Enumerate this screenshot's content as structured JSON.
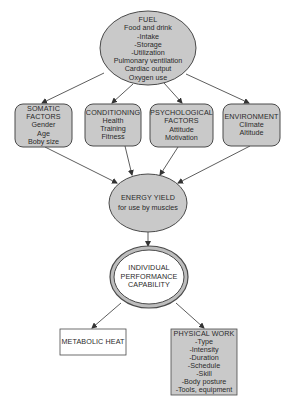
{
  "colors": {
    "fill": "#c9c9c9",
    "stroke": "#4a4a4a",
    "white_fill": "#ffffff"
  },
  "nodes": {
    "fuel": {
      "title": "FUEL",
      "lines": [
        "Food and drink",
        "-Intake",
        "-Storage",
        "-Utilization",
        "Pulmonary ventilation",
        "Cardiac output",
        "Oxygen use"
      ]
    },
    "somatic": {
      "title": "SOMATIC",
      "title2": "FACTORS",
      "lines": [
        "Gender",
        "Age",
        "Boby size"
      ]
    },
    "conditioning": {
      "title": "CONDITIONING",
      "lines": [
        "Health",
        "Training",
        "Fitness"
      ]
    },
    "psychological": {
      "title": "PSYCHOLOGICAL",
      "title2": "FACTORS",
      "lines": [
        "Attitude",
        "Motivation"
      ]
    },
    "environment": {
      "title": "ENVIRONMENT",
      "lines": [
        "Climate",
        "Altitude"
      ]
    },
    "energy": {
      "title": "ENERGY YIELD",
      "lines": [
        "for use by muscles"
      ]
    },
    "performance": {
      "lines": [
        "INDIVIDUAL",
        "PERFORMANCE",
        "CAPABILITY"
      ]
    },
    "metabolic": {
      "title": "METABOLIC HEAT"
    },
    "physical": {
      "title": "PHYSICAL WORK",
      "lines": [
        "-Type",
        "-Intensity",
        "-Duration",
        "-Schedule",
        "-Skill",
        "-Body posture",
        "-Tools, equipment"
      ]
    }
  },
  "edges": [
    {
      "from": "fuel",
      "to": "somatic"
    },
    {
      "from": "fuel",
      "to": "conditioning"
    },
    {
      "from": "fuel",
      "to": "psychological"
    },
    {
      "from": "fuel",
      "to": "environment"
    },
    {
      "from": "somatic",
      "to": "energy"
    },
    {
      "from": "conditioning",
      "to": "energy"
    },
    {
      "from": "psychological",
      "to": "energy"
    },
    {
      "from": "environment",
      "to": "energy"
    },
    {
      "from": "energy",
      "to": "performance"
    },
    {
      "from": "performance",
      "to": "metabolic"
    },
    {
      "from": "performance",
      "to": "physical"
    }
  ]
}
